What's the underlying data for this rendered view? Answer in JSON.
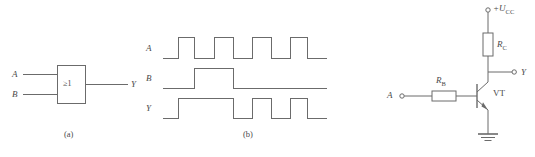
{
  "figure": {
    "parts": [
      {
        "id": "a",
        "caption": "(a)"
      },
      {
        "id": "b",
        "caption": "(b)"
      }
    ]
  },
  "gate_diagram": {
    "symbol_text": "≥1",
    "input_a_label": "A",
    "input_b_label": "B",
    "output_label": "Y",
    "caption": "(a)"
  },
  "waveform_diagram": {
    "caption": "(b)",
    "row_labels": [
      "A",
      "B",
      "Y"
    ],
    "signals": [
      {
        "name": "A",
        "levels": [
          0,
          1,
          0,
          1,
          0,
          1,
          0,
          1,
          0
        ],
        "description": "four narrow high pulses"
      },
      {
        "name": "B",
        "levels": [
          0,
          0,
          1,
          0,
          0,
          0,
          0,
          0,
          0
        ],
        "description": "single wide high pulse"
      },
      {
        "name": "Y",
        "levels": [
          0,
          1,
          1,
          0,
          1,
          0,
          1,
          0,
          0
        ],
        "description": "logical OR of A and B"
      }
    ]
  },
  "transistor_circuit": {
    "supply_label": "+U",
    "supply_subscript": "CC",
    "collector_resistor_label": "R",
    "collector_resistor_subscript": "C",
    "base_resistor_label": "R",
    "base_resistor_subscript": "B",
    "transistor_label": "VT",
    "input_label": "A",
    "output_label": "Y"
  },
  "colors": {
    "line": "#6b6b6b",
    "text": "#4a4a4a",
    "background": "#ffffff"
  }
}
